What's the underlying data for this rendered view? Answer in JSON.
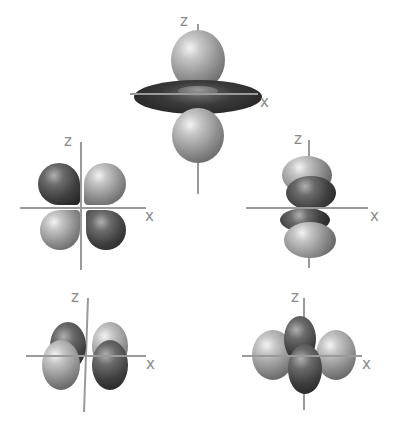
{
  "figure": {
    "orbitals": [
      {
        "id": "dz2",
        "z_label": "z",
        "x_label": "x"
      },
      {
        "id": "dxz",
        "z_label": "z",
        "x_label": "x"
      },
      {
        "id": "dyz",
        "z_label": "z",
        "x_label": "x"
      },
      {
        "id": "dxy",
        "z_label": "z",
        "x_label": "x"
      },
      {
        "id": "dx2-y2",
        "z_label": "z",
        "x_label": "x"
      }
    ]
  },
  "colors": {
    "background": "#ffffff",
    "axis": "#9a9a9a",
    "label": "#8a8a8a",
    "lobe_light": "#b0b0b0",
    "lobe_dark": "#3a3a3a"
  }
}
